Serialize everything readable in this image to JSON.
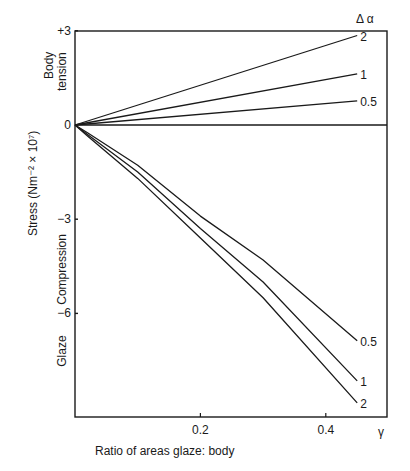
{
  "chart_data": {
    "type": "line",
    "title": "",
    "xlabel": "Ratio of areas glaze: body",
    "x_symbol": "γ",
    "ylabel": "Stress (Nm⁻² × 10⁷)",
    "legend_title": "Δ α",
    "xlim": [
      0,
      0.5
    ],
    "ylim": [
      -9.3,
      3
    ],
    "x_ticks": [
      {
        "value": 0.2,
        "label": "0.2"
      },
      {
        "value": 0.4,
        "label": "0.4"
      }
    ],
    "y_ticks": [
      {
        "value": 3,
        "label": "+3"
      },
      {
        "value": 0,
        "label": "0"
      },
      {
        "value": -3,
        "label": "−3"
      },
      {
        "value": -6,
        "label": "−6"
      }
    ],
    "region_labels": [
      {
        "text": "Body",
        "y": 1.9
      },
      {
        "text": "tension",
        "y": 1.7
      },
      {
        "text": "Compression",
        "y": -4.6
      },
      {
        "text": "Glaze",
        "y": -7.2
      }
    ],
    "grid": false,
    "series": [
      {
        "name": "2",
        "region": "body tension",
        "x": [
          0,
          0.45
        ],
        "y": [
          0,
          2.85
        ]
      },
      {
        "name": "1",
        "region": "body tension",
        "x": [
          0,
          0.45
        ],
        "y": [
          0,
          1.63
        ]
      },
      {
        "name": "0.5",
        "region": "body tension",
        "x": [
          0,
          0.45
        ],
        "y": [
          0,
          0.77
        ]
      },
      {
        "name": "0.5",
        "region": "glaze compression",
        "x": [
          0,
          0.02,
          0.1,
          0.2,
          0.3,
          0.45
        ],
        "y": [
          0,
          -0.25,
          -1.28,
          -2.9,
          -4.3,
          -6.87
        ]
      },
      {
        "name": "1",
        "region": "glaze compression",
        "x": [
          0,
          0.02,
          0.1,
          0.2,
          0.3,
          0.45
        ],
        "y": [
          0,
          -0.3,
          -1.5,
          -3.3,
          -5.0,
          -8.15
        ]
      },
      {
        "name": "2",
        "region": "glaze compression",
        "x": [
          0,
          0.02,
          0.1,
          0.2,
          0.3,
          0.45
        ],
        "y": [
          0,
          -0.35,
          -1.7,
          -3.6,
          -5.5,
          -8.85
        ]
      }
    ]
  }
}
